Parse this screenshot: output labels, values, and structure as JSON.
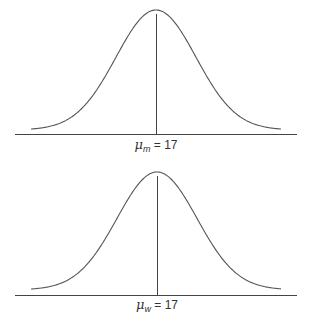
{
  "chart_data": [
    {
      "type": "line",
      "title": "",
      "description": "Normal distribution curve for men",
      "mean_label": {
        "symbol": "μ",
        "subscript": "m",
        "equals": "= 17"
      },
      "mean": 17,
      "xlabel": "",
      "ylabel": "",
      "grid": false,
      "legend": null,
      "geometry": {
        "baseline_y": 134,
        "axis_x0": 15,
        "axis_x1": 297,
        "center_x": 156,
        "peak_y": 10,
        "tail_y": 129,
        "curve_x0": 31,
        "curve_x1": 281,
        "sigma_px": 40,
        "meanline_top": 14,
        "label_y": 137
      }
    },
    {
      "type": "line",
      "title": "",
      "description": "Normal distribution curve for women",
      "mean_label": {
        "symbol": "μ",
        "subscript": "w",
        "equals": "= 17"
      },
      "mean": 17,
      "xlabel": "",
      "ylabel": "",
      "grid": false,
      "legend": null,
      "geometry": {
        "baseline_y": 295,
        "axis_x0": 15,
        "axis_x1": 297,
        "center_x": 157,
        "peak_y": 172,
        "tail_y": 289,
        "curve_x0": 31,
        "curve_x1": 281,
        "sigma_px": 40,
        "meanline_top": 176,
        "label_y": 297
      }
    }
  ],
  "colors": {
    "curve": "#555555",
    "axis": "#444444",
    "text": "#333333"
  }
}
